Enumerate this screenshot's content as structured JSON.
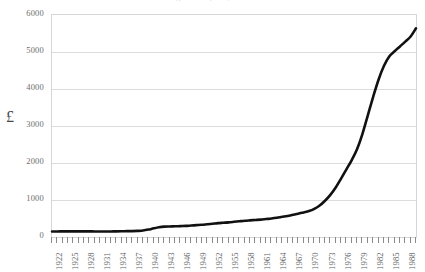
{
  "chart_data": {
    "type": "line",
    "title": "Average house price, 1922-1990",
    "xlabel": "",
    "ylabel": "£",
    "ylim": [
      0,
      6000
    ],
    "xlim": [
      1922,
      1990
    ],
    "ytick_values": [
      0,
      1000,
      2000,
      3000,
      4000,
      5000,
      6000
    ],
    "ytick_labels": [
      "0",
      "1000",
      "2000",
      "3000",
      "4000",
      "5000",
      "6000"
    ],
    "grid": true,
    "legend": false,
    "legend_position": "none",
    "line_color": "#111111",
    "grid_color": "#dcdcdc",
    "frame_color": "#d6d6d6",
    "xtick_labels": [
      "1922",
      "1925",
      "1928",
      "1931",
      "1934",
      "1937",
      "1940",
      "1943",
      "1946",
      "1949",
      "1952",
      "1955",
      "1958",
      "1961",
      "1964",
      "1967",
      "1970",
      "1973",
      "1976",
      "1979",
      "1982",
      "1985",
      "1988"
    ],
    "xtick_label_years": [
      1922,
      1925,
      1928,
      1931,
      1934,
      1937,
      1940,
      1943,
      1946,
      1949,
      1952,
      1955,
      1958,
      1961,
      1964,
      1967,
      1970,
      1973,
      1976,
      1979,
      1982,
      1985,
      1988
    ],
    "x": [
      1922,
      1923,
      1924,
      1925,
      1926,
      1927,
      1928,
      1929,
      1930,
      1931,
      1932,
      1933,
      1934,
      1935,
      1936,
      1937,
      1938,
      1939,
      1940,
      1941,
      1942,
      1943,
      1944,
      1945,
      1946,
      1947,
      1948,
      1949,
      1950,
      1951,
      1952,
      1953,
      1954,
      1955,
      1956,
      1957,
      1958,
      1959,
      1960,
      1961,
      1962,
      1963,
      1964,
      1965,
      1966,
      1967,
      1968,
      1969,
      1970,
      1971,
      1972,
      1973,
      1974,
      1975,
      1976,
      1977,
      1978,
      1979,
      1980,
      1981,
      1982,
      1983,
      1984,
      1985,
      1986,
      1987,
      1988,
      1989,
      1990
    ],
    "values": [
      150,
      150,
      152,
      152,
      152,
      152,
      152,
      152,
      150,
      150,
      150,
      150,
      152,
      155,
      158,
      160,
      165,
      175,
      200,
      235,
      265,
      280,
      285,
      290,
      295,
      300,
      310,
      320,
      330,
      345,
      360,
      375,
      385,
      395,
      410,
      425,
      440,
      450,
      460,
      470,
      485,
      500,
      520,
      545,
      570,
      600,
      630,
      665,
      700,
      760,
      850,
      980,
      1140,
      1340,
      1580,
      1830,
      2080,
      2380,
      2790,
      3290,
      3790,
      4250,
      4620,
      4880,
      5020,
      5150,
      5280,
      5420,
      5640
    ]
  }
}
